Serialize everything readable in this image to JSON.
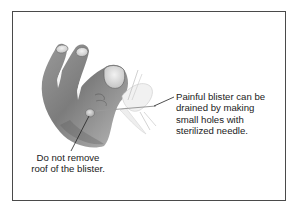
{
  "figure": {
    "border_color": "#4a4a4a",
    "background_color": "#ffffff",
    "annotations": [
      {
        "id": "drain-note",
        "lines": [
          "Painful blister can be",
          "drained by making",
          "small holes with",
          "sterilized needle."
        ],
        "text": "Painful blister can be\ndrained by making\nsmall holes with\nsterilized needle."
      },
      {
        "id": "roof-note",
        "lines": [
          "Do not remove",
          "roof of the blister."
        ],
        "text": "Do not remove\nroof of the blister."
      }
    ]
  }
}
